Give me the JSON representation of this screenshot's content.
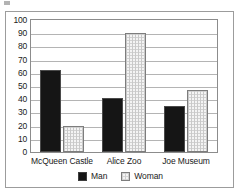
{
  "chart_data": {
    "type": "bar",
    "title": "",
    "xlabel": "",
    "ylabel": "",
    "categories": [
      "McQueen Castle",
      "Alice Zoo",
      "Joe Museum"
    ],
    "series": [
      {
        "name": "Man",
        "color": "#151515",
        "values": [
          62,
          41,
          35
        ]
      },
      {
        "name": "Woman",
        "color": "#f4f4f4",
        "values": [
          20,
          90,
          47
        ]
      }
    ],
    "ylim": [
      0,
      100
    ],
    "ytick_step": 10,
    "yticks": [
      0,
      10,
      20,
      30,
      40,
      50,
      60,
      70,
      80,
      90,
      100
    ],
    "ytick_labels": [
      "0",
      "10",
      "20",
      "30",
      "40",
      "50",
      "60",
      "70",
      "80",
      "90",
      "100"
    ],
    "grid": true,
    "legend_position": "bottom",
    "legend": [
      "Man",
      "Woman"
    ]
  }
}
